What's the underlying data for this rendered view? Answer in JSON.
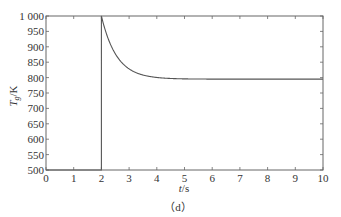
{
  "chart_data": {
    "type": "line",
    "title": "",
    "caption": "（d）",
    "xlabel": "t/s",
    "ylabel": "T_g/K",
    "xlim": [
      0,
      10
    ],
    "ylim": [
      500,
      1000
    ],
    "grid": false,
    "legend": null,
    "xticks": [
      "0",
      "1",
      "2",
      "3",
      "4",
      "5",
      "6",
      "7",
      "8",
      "9",
      "10"
    ],
    "yticks": [
      "500",
      "550",
      "600",
      "650",
      "700",
      "750",
      "800",
      "850",
      "900",
      "950",
      "1 000"
    ],
    "series": [
      {
        "name": "T_g",
        "color": "#555555",
        "x": [
          0,
          2.0,
          2.0,
          2.05,
          2.1,
          2.2,
          2.3,
          2.5,
          2.75,
          3.0,
          3.25,
          3.5,
          3.75,
          4.0,
          4.5,
          5.0,
          6.0,
          7.0,
          8.0,
          9.0,
          10.0
        ],
        "y": [
          500,
          500,
          1000,
          975,
          955,
          925,
          900,
          868,
          840,
          822,
          810,
          803,
          799,
          797,
          795,
          795,
          795,
          795,
          795,
          795,
          795
        ]
      }
    ]
  }
}
